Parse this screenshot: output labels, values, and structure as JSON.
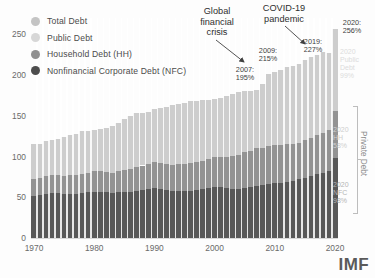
{
  "legend": {
    "items": [
      {
        "label": "Total Debt",
        "color": "#c4c4c4",
        "key": "total"
      },
      {
        "label": "Public Debt",
        "color": "#d5d5d5",
        "key": "public"
      },
      {
        "label": "Household Debt (HH)",
        "color": "#909090",
        "key": "hh"
      },
      {
        "label": "Nonfinancial Corporate Debt (NFC)",
        "color": "#4d4d4d",
        "key": "nfc"
      }
    ]
  },
  "annotations": {
    "gfc_title": "Global\nfinancial\ncrisis",
    "gfc_line1": "Global",
    "gfc_line2": "financial",
    "gfc_line3": "crisis",
    "covid_line1": "COVID-19",
    "covid_line2": "pandemic",
    "points": [
      {
        "year": "2007:",
        "value": "195%"
      },
      {
        "year": "2009:",
        "value": "215%"
      },
      {
        "year": "2019:",
        "value": "227%"
      },
      {
        "year": "2020:",
        "value": "256%"
      }
    ]
  },
  "right_labels": {
    "public": {
      "l1": "2020",
      "l2": "Public",
      "l3": "Debt",
      "l4": "99%"
    },
    "hh": {
      "l1": "2020",
      "l2": "HH",
      "l3": "58%"
    },
    "nfc": {
      "l1": "2020",
      "l2": "NFC",
      "l3": "98%"
    },
    "private_bracket": "Private Debt"
  },
  "logo": "IMF",
  "chart_data": {
    "type": "area",
    "title": "",
    "subtitle": "",
    "xlabel": "",
    "ylabel": "",
    "ylim": [
      0,
      270
    ],
    "xlim": [
      1970,
      2020
    ],
    "grid": false,
    "legend_position": "top-left",
    "stacked": true,
    "units": "percent of GDP",
    "yticks": [
      0,
      50,
      100,
      150,
      200,
      250
    ],
    "ytick_labels": [
      "0",
      "50",
      "100",
      "150",
      "200",
      "250"
    ],
    "xticks": [
      1970,
      1980,
      1990,
      2000,
      2010,
      2020
    ],
    "xtick_labels": [
      "1970",
      "1980",
      "1990",
      "2000",
      "2010",
      "2020"
    ],
    "x": [
      1970,
      1971,
      1972,
      1973,
      1974,
      1975,
      1976,
      1977,
      1978,
      1979,
      1980,
      1981,
      1982,
      1983,
      1984,
      1985,
      1986,
      1987,
      1988,
      1989,
      1990,
      1991,
      1992,
      1993,
      1994,
      1995,
      1996,
      1997,
      1998,
      1999,
      2000,
      2001,
      2002,
      2003,
      2004,
      2005,
      2006,
      2007,
      2008,
      2009,
      2010,
      2011,
      2012,
      2013,
      2014,
      2015,
      2016,
      2017,
      2018,
      2019,
      2020
    ],
    "series": [
      {
        "name": "Nonfinancial Corporate Debt (NFC)",
        "color": "#585858",
        "values": [
          52,
          53,
          54,
          55,
          55,
          54,
          54,
          54,
          55,
          56,
          57,
          57,
          56,
          55,
          56,
          57,
          57,
          58,
          59,
          60,
          61,
          60,
          59,
          58,
          58,
          58,
          58,
          59,
          60,
          61,
          62,
          62,
          61,
          60,
          60,
          61,
          62,
          64,
          65,
          66,
          67,
          68,
          69,
          70,
          72,
          74,
          76,
          78,
          80,
          82,
          98
        ]
      },
      {
        "name": "Household Debt (HH)",
        "color": "#939393",
        "values": [
          21,
          21,
          22,
          22,
          22,
          22,
          23,
          23,
          24,
          24,
          25,
          25,
          25,
          25,
          26,
          27,
          28,
          29,
          30,
          31,
          32,
          32,
          32,
          32,
          33,
          33,
          34,
          34,
          35,
          36,
          37,
          38,
          39,
          41,
          42,
          44,
          45,
          46,
          46,
          47,
          47,
          46,
          46,
          45,
          45,
          46,
          47,
          48,
          49,
          50,
          58
        ]
      },
      {
        "name": "Public Debt",
        "color": "#cdcdcd",
        "values": [
          42,
          42,
          43,
          43,
          45,
          48,
          50,
          51,
          52,
          51,
          51,
          52,
          54,
          57,
          59,
          62,
          65,
          66,
          65,
          64,
          65,
          67,
          70,
          73,
          74,
          75,
          76,
          75,
          74,
          73,
          72,
          72,
          74,
          76,
          77,
          76,
          74,
          72,
          78,
          88,
          90,
          92,
          95,
          96,
          97,
          98,
          99,
          99,
          99,
          95,
          100
        ]
      }
    ],
    "total_label_points": [
      {
        "year": 2007,
        "total": 195,
        "label": "2007: 195%"
      },
      {
        "year": 2009,
        "total": 215,
        "label": "2009: 215%"
      },
      {
        "year": 2019,
        "total": 227,
        "label": "2019: 227%"
      },
      {
        "year": 2020,
        "total": 256,
        "label": "2020: 256%"
      }
    ],
    "end_values_2020": {
      "public": 100,
      "hh": 58,
      "nfc": 98,
      "total": 256
    },
    "annotations": [
      {
        "text": "Global financial crisis",
        "points_to_year": 2007
      },
      {
        "text": "COVID-19 pandemic",
        "points_to_year": 2020
      }
    ]
  }
}
